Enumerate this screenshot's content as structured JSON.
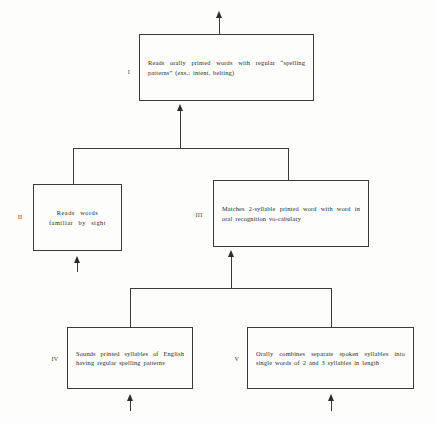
{
  "diagram": {
    "type": "learning-hierarchy-flowchart",
    "title": "",
    "line_color": "#3a3a38",
    "background_color": "#fdfdfc",
    "text_color": "#2b2b2a",
    "nodes": [
      {
        "numeral": "I",
        "text": "Reads orally printed words with regular “spelling patterns” (exs.: intent, belting)"
      },
      {
        "numeral": "II",
        "text": "Reads words familiar by sight"
      },
      {
        "numeral": "III",
        "text": "Matches 2-syllable printed word with word in oral recognition vo-cabulary"
      },
      {
        "numeral": "IV",
        "text": "Sounds printed syllables of English having regular spelling patterns"
      },
      {
        "numeral": "V",
        "text": "Orally combines separate spoken syllables into single words of 2 and 3 syllables in length"
      }
    ]
  }
}
